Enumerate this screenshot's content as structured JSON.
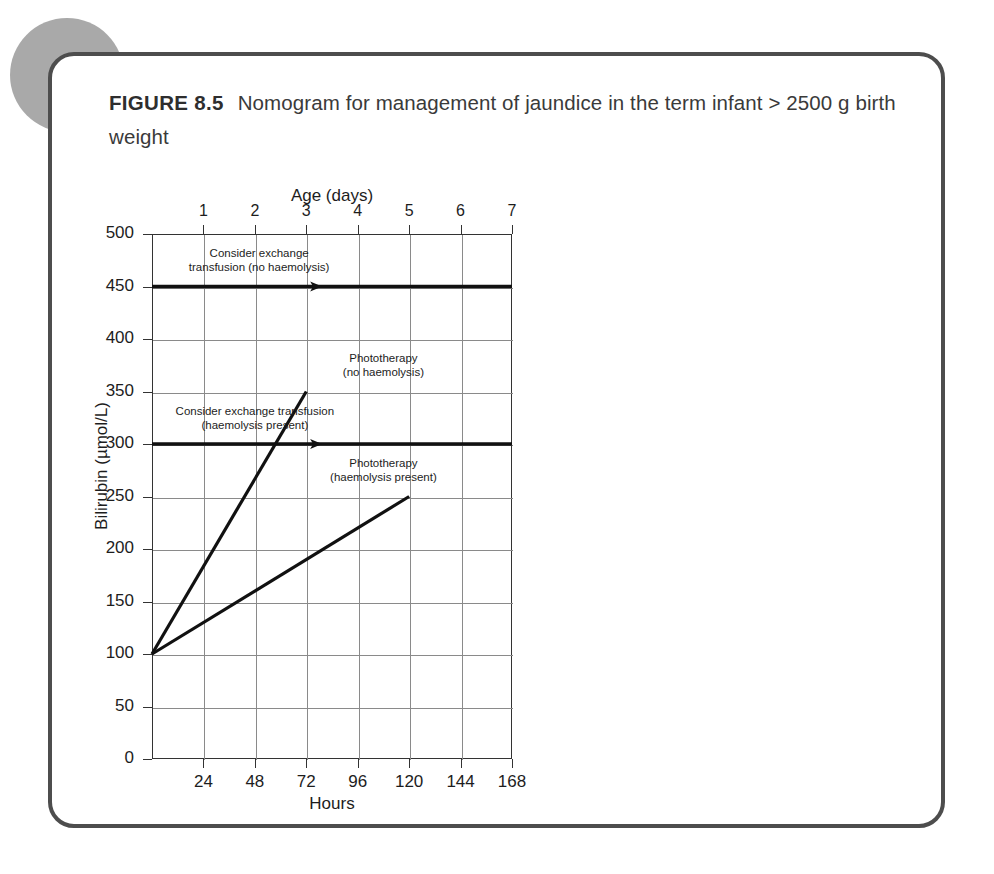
{
  "figure": {
    "label": "FIGURE 8.5",
    "caption": "Nomogram for management of jaundice in the term infant > 2500 g birth weight"
  },
  "chart_data": {
    "type": "line",
    "title": "Nomogram for management of jaundice in the term infant > 2500 g birth weight",
    "xlabel": "Hours",
    "ylabel": "Bilirubin (µmol/L)",
    "x2label": "Age (days)",
    "xlim": [
      0,
      168
    ],
    "ylim": [
      0,
      500
    ],
    "grid": true,
    "legend": "none",
    "x_ticks": [
      24,
      48,
      72,
      96,
      120,
      144,
      168
    ],
    "x_tick_labels": [
      "24",
      "48",
      "72",
      "96",
      "120",
      "144",
      "168"
    ],
    "x2_ticks": [
      24,
      48,
      72,
      96,
      120,
      144,
      168
    ],
    "x2_tick_labels": [
      "1",
      "2",
      "3",
      "4",
      "5",
      "6",
      "7"
    ],
    "y_ticks": [
      0,
      50,
      100,
      150,
      200,
      250,
      300,
      350,
      400,
      450,
      500
    ],
    "y_tick_labels": [
      "0",
      "50",
      "100",
      "150",
      "200",
      "250",
      "300",
      "350",
      "400",
      "450",
      "500"
    ],
    "series": [
      {
        "name": "Exchange transfusion threshold (no haemolysis)",
        "style": "thick-horizontal-with-arrow",
        "x": [
          0,
          168
        ],
        "y": [
          450,
          450
        ]
      },
      {
        "name": "Phototherapy threshold (no haemolysis)",
        "style": "thick-horizontal-with-arrow",
        "x": [
          0,
          168
        ],
        "y": [
          300,
          300
        ]
      },
      {
        "name": "Exchange transfusion rise line (haemolysis present)",
        "style": "diagonal",
        "x": [
          0,
          72
        ],
        "y": [
          100,
          350
        ]
      },
      {
        "name": "Phototherapy rise line (haemolysis present)",
        "style": "diagonal",
        "x": [
          0,
          120
        ],
        "y": [
          100,
          250
        ]
      }
    ],
    "annotations": [
      {
        "id": "note-exchange-no-haemolysis",
        "line1": "Consider exchange",
        "line2": "transfusion (no haemolysis)",
        "x": 50,
        "y": 475
      },
      {
        "id": "note-phototherapy-no-haemolysis",
        "line1": "Phototherapy",
        "line2": "(no haemolysis)",
        "x": 108,
        "y": 375
      },
      {
        "id": "note-exchange-haemolysis-present",
        "line1": "Consider exchange transfusion",
        "line2": "(haemolysis present)",
        "x": 48,
        "y": 325
      },
      {
        "id": "note-phototherapy-haemolysis-present",
        "line1": "Phototherapy",
        "line2": "(haemolysis present)",
        "x": 108,
        "y": 275
      }
    ]
  },
  "colors": {
    "card_border": "#4d4d4d",
    "deco_circle": "#a9a9a9",
    "axis": "#333333",
    "grid": "#8a8a8a",
    "threshold": "#111111",
    "text": "#1d1d1d"
  }
}
